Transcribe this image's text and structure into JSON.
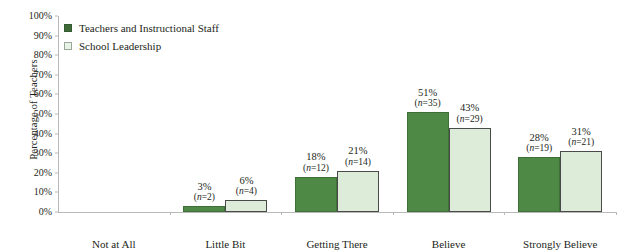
{
  "chart_data": {
    "type": "bar",
    "title": "",
    "xlabel": "",
    "ylabel": "Percentage of Teachers",
    "ylim": [
      0,
      100
    ],
    "ytick_labels": [
      "0%",
      "10%",
      "20%",
      "30%",
      "40%",
      "50%",
      "60%",
      "70%",
      "80%",
      "90%",
      "100%"
    ],
    "ytick_values": [
      0,
      10,
      20,
      30,
      40,
      50,
      60,
      70,
      80,
      90,
      100
    ],
    "grid": false,
    "legend_position": "top-left",
    "categories": [
      "Not at All",
      "Little Bit",
      "Getting There",
      "Believe",
      "Strongly Believe"
    ],
    "series": [
      {
        "name": "Teachers and Instructional Staff",
        "color": "#4e8a45",
        "values": [
          0,
          3,
          18,
          51,
          28
        ],
        "counts": [
          0,
          2,
          12,
          35,
          19
        ],
        "value_labels": [
          "",
          "3%",
          "18%",
          "51%",
          "28%"
        ],
        "count_labels": [
          "",
          "(n=2)",
          "(n=12)",
          "(n=35)",
          "(n=19)"
        ]
      },
      {
        "name": "School Leadership",
        "color": "#dcecd8",
        "values": [
          0,
          6,
          21,
          43,
          31
        ],
        "counts": [
          0,
          4,
          14,
          29,
          21
        ],
        "value_labels": [
          "",
          "6%",
          "21%",
          "43%",
          "31%"
        ],
        "count_labels": [
          "",
          "(n=4)",
          "(n=14)",
          "(n=29)",
          "(n=21)"
        ]
      }
    ]
  },
  "legend": {
    "items": [
      {
        "label": "Teachers and Instructional Staff"
      },
      {
        "label": "School Leadership"
      }
    ]
  }
}
